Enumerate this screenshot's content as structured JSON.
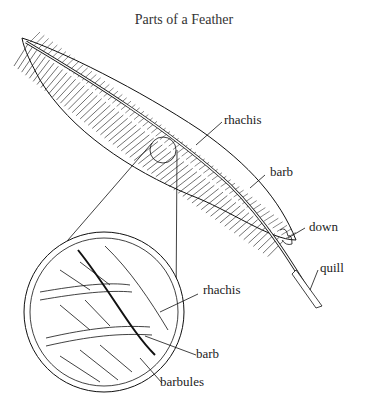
{
  "title": "Parts of a Feather",
  "labels": {
    "rhachis_main": "rhachis",
    "barb_main": "barb",
    "down": "down",
    "quill": "quill",
    "rhachis_detail": "rhachis",
    "barb_detail": "barb",
    "barbules": "barbules"
  },
  "colors": {
    "ink": "#1a1a1a",
    "background": "#ffffff"
  }
}
